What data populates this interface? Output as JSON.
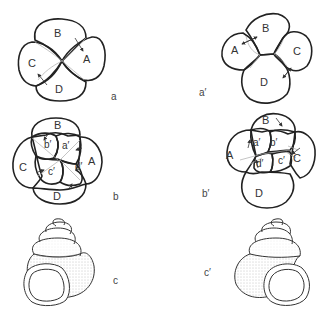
{
  "figure": {
    "panels": [
      {
        "id": "a",
        "label": "a",
        "description": "Four-cell embryo, dextral cleavage (top view)",
        "cells": [
          "A",
          "B",
          "C",
          "D"
        ]
      },
      {
        "id": "a_prime",
        "label": "a′",
        "description": "Four-cell embryo, sinistral cleavage (top view)",
        "cells": [
          "A",
          "B",
          "C",
          "D"
        ]
      },
      {
        "id": "b",
        "label": "b",
        "description": "Eight-cell embryo with micromeres, dextral",
        "macromeres": [
          "A",
          "B",
          "C",
          "D"
        ],
        "micromeres": [
          "a′",
          "b′",
          "c′",
          "d′"
        ]
      },
      {
        "id": "b_prime",
        "label": "b′",
        "description": "Eight-cell embryo with micromeres, sinistral",
        "macromeres": [
          "A",
          "B",
          "C",
          "D"
        ],
        "micromeres": [
          "a′",
          "b′",
          "c′",
          "d′"
        ]
      },
      {
        "id": "c",
        "label": "c",
        "description": "Dextral snail shell"
      },
      {
        "id": "c_prime",
        "label": "c′",
        "description": "Sinistral snail shell"
      }
    ]
  },
  "labels": {
    "a": {
      "A": "A",
      "B": "B",
      "C": "C",
      "D": "D"
    },
    "a2": {
      "A": "A",
      "B": "B",
      "C": "C",
      "D": "D"
    },
    "b": {
      "A": "A",
      "B": "B",
      "C": "C",
      "D": "D",
      "a": "a′",
      "b": "b′",
      "c": "c′",
      "d": "d′"
    },
    "b2": {
      "A": "A",
      "B": "B",
      "C": "C",
      "D": "D",
      "a": "a′",
      "b": "b′",
      "c": "c′",
      "d": "d′"
    }
  },
  "colors": {
    "ink": "#222222",
    "faint": "#aaaaaa",
    "background": "#ffffff"
  }
}
